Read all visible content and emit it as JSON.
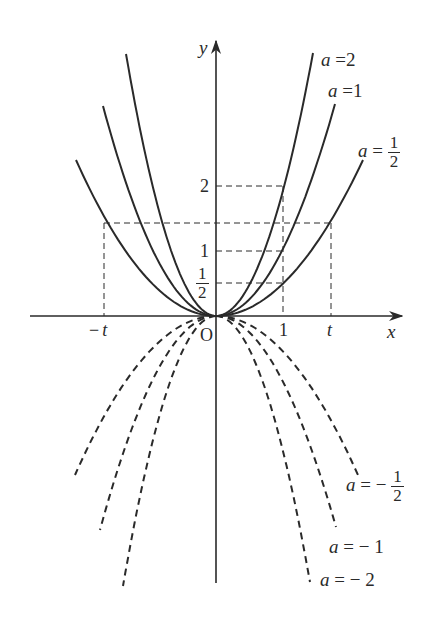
{
  "figure": {
    "background": "#ffffff",
    "ink_color": "#2a2a2a"
  },
  "axes": {
    "x_label": "x",
    "y_label": "y",
    "origin_label": "O",
    "origin_px": [
      216,
      316
    ],
    "x_unit_px": 67,
    "y_unit_px": 65,
    "x_axis_px": [
      30,
      402
    ],
    "y_axis_px": [
      583,
      41
    ]
  },
  "ticks": {
    "x": [
      {
        "label": "−t",
        "prefix": "−",
        "var": "t",
        "x_px": 104
      },
      {
        "label": "1",
        "x_px": 283
      },
      {
        "label": "t",
        "var": "t",
        "x_px": 331
      }
    ],
    "y": [
      {
        "label": "2",
        "y_px": 186
      },
      {
        "label": "1",
        "y_px": 251
      },
      {
        "label": "1/2",
        "num": "1",
        "den": "2",
        "y_px": 283
      }
    ]
  },
  "guides": {
    "t_value_px": 115,
    "t_height_px": 223,
    "style": "dashed"
  },
  "curves": [
    {
      "a": 2,
      "label": "a = 2",
      "label_a": "a",
      "label_eq": "=",
      "label_val": "2",
      "style": "solid",
      "top_left": [
        126,
        54
      ],
      "top_right": [
        313,
        53
      ]
    },
    {
      "a": 1,
      "label": "a = 1",
      "label_a": "a",
      "label_eq": "=",
      "label_val": "1",
      "style": "solid",
      "top_left": [
        103,
        106
      ],
      "top_right": [
        335,
        104
      ]
    },
    {
      "a": 0.5,
      "label": "a = 1/2",
      "label_a": "a",
      "label_eq": "=",
      "label_num": "1",
      "label_den": "2",
      "style": "solid",
      "top_left": [
        76,
        160
      ],
      "top_right": [
        363,
        160
      ]
    },
    {
      "a": -0.5,
      "label": "a = −1/2",
      "label_a": "a",
      "label_eq": "= −",
      "label_num": "1",
      "label_den": "2",
      "style": "dashed",
      "bottom_left": [
        75,
        475
      ],
      "bottom_right": [
        358,
        475
      ]
    },
    {
      "a": -1,
      "label": "a = −1",
      "label_a": "a",
      "label_eq": "= −",
      "label_val": "1",
      "style": "dashed",
      "bottom_left": [
        100,
        530
      ],
      "bottom_right": [
        336,
        527
      ]
    },
    {
      "a": -2,
      "label": "a = −2",
      "label_a": "a",
      "label_eq": "= −",
      "label_val": "2",
      "style": "dashed",
      "bottom_left": [
        123,
        586
      ],
      "bottom_right": [
        310,
        582
      ]
    }
  ],
  "chart_data": {
    "type": "line",
    "xlabel": "x",
    "ylabel": "y",
    "series": [
      {
        "name": "a = 2",
        "a": 2,
        "style": "solid"
      },
      {
        "name": "a = 1",
        "a": 1,
        "style": "solid"
      },
      {
        "name": "a = 1/2",
        "a": 0.5,
        "style": "solid"
      },
      {
        "name": "a = −1/2",
        "a": -0.5,
        "style": "dashed"
      },
      {
        "name": "a = −1",
        "a": -1,
        "style": "dashed"
      },
      {
        "name": "a = −2",
        "a": -2,
        "style": "dashed"
      }
    ],
    "x_ticks": [
      "−t",
      "1",
      "t"
    ],
    "y_ticks": [
      "1/2",
      "1",
      "2"
    ],
    "annotations": [
      "O",
      "dashed guides at x=1 to y=1/2,1,2",
      "dashed guides at x=±t to y=t²/2"
    ],
    "xlim": [
      -2.8,
      2.8
    ],
    "ylim": [
      -4.1,
      4.2
    ],
    "grid": false
  }
}
